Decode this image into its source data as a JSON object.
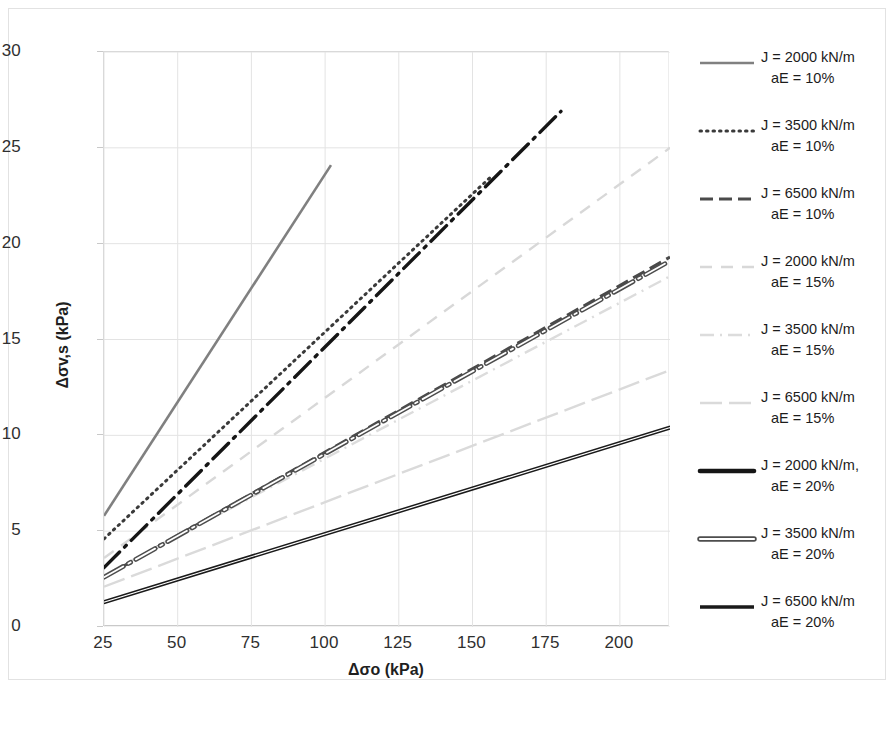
{
  "axes": {
    "xlabel": "Δσo (kPa)",
    "ylabel": "Δσv,s (kPa)",
    "xticks": [
      "25",
      "50",
      "75",
      "100",
      "125",
      "150",
      "175",
      "200"
    ],
    "yticks": [
      "0",
      "5",
      "10",
      "15",
      "20",
      "25",
      "30"
    ]
  },
  "legend": {
    "items": [
      {
        "line1": "J = 2000 kN/m",
        "line2": "aE = 10%",
        "style": "solid-gray",
        "color": "#808080"
      },
      {
        "line1": "J = 3500 kN/m",
        "line2": "aE = 10%",
        "style": "dotted-dark",
        "color": "#3a3a3a"
      },
      {
        "line1": "J = 6500 kN/m",
        "line2": "aE = 10%",
        "style": "dashed-dark",
        "color": "#4a4a4a"
      },
      {
        "line1": "J = 2000 kN/m",
        "line2": "aE = 15%",
        "style": "dashed-light",
        "color": "#d8d8d8"
      },
      {
        "line1": "J = 3500 kN/m",
        "line2": "aE = 15%",
        "style": "dashdot-light",
        "color": "#dcdcdc"
      },
      {
        "line1": "J = 6500 kN/m",
        "line2": "aE = 15%",
        "style": "longdash-light",
        "color": "#dadada"
      },
      {
        "line1": "J = 2000 kN/m,",
        "line2": "aE = 20%",
        "style": "dashdot-black",
        "color": "#151515"
      },
      {
        "line1": "J = 3500 kN/m",
        "line2": "aE = 20%",
        "style": "dashdot-double",
        "color": "#4d4d4d"
      },
      {
        "line1": "J = 6500 kN/m",
        "line2": "aE = 20%",
        "style": "solid-black",
        "color": "#1a1a1a"
      }
    ]
  },
  "chart_data": {
    "type": "line",
    "title": "",
    "xlabel": "Δσo (kPa)",
    "ylabel": "Δσv,s (kPa)",
    "xlim": [
      25,
      217
    ],
    "ylim": [
      0,
      30
    ],
    "xticks": [
      25,
      50,
      75,
      100,
      125,
      150,
      175,
      200
    ],
    "yticks": [
      0,
      5,
      10,
      15,
      20,
      25,
      30
    ],
    "grid": true,
    "legend_position": "right",
    "series": [
      {
        "name": "J = 2000 kN/m, aE = 10%",
        "style": "solid-gray",
        "color": "#808080",
        "x": [
          25,
          102
        ],
        "y": [
          5.8,
          24.1
        ]
      },
      {
        "name": "J = 3500 kN/m, aE = 10%",
        "style": "dotted-dark",
        "color": "#3a3a3a",
        "x": [
          25,
          157
        ],
        "y": [
          4.6,
          23.6
        ]
      },
      {
        "name": "J = 6500 kN/m, aE = 10%",
        "style": "dashed-dark",
        "color": "#4a4a4a",
        "x": [
          25,
          217
        ],
        "y": [
          2.6,
          19.3
        ]
      },
      {
        "name": "J = 2000 kN/m, aE = 15%",
        "style": "dashed-light",
        "color": "#d8d8d8",
        "x": [
          25,
          217
        ],
        "y": [
          3.6,
          25.0
        ]
      },
      {
        "name": "J = 3500 kN/m, aE = 15%",
        "style": "dashdot-light",
        "color": "#dcdcdc",
        "x": [
          25,
          217
        ],
        "y": [
          2.7,
          18.3
        ]
      },
      {
        "name": "J = 6500 kN/m, aE = 15%",
        "style": "longdash-light",
        "color": "#dadada",
        "x": [
          25,
          217
        ],
        "y": [
          2.1,
          13.4
        ]
      },
      {
        "name": "J = 2000 kN/m, aE = 20%",
        "style": "dashdot-black",
        "color": "#151515",
        "x": [
          25,
          180
        ],
        "y": [
          3.1,
          26.9
        ]
      },
      {
        "name": "J = 3500 kN/m, aE = 20%",
        "style": "dashdot-double",
        "color": "#4d4d4d",
        "x": [
          25,
          217
        ],
        "y": [
          2.6,
          19.1
        ]
      },
      {
        "name": "J = 6500 kN/m, aE = 20%",
        "style": "solid-black",
        "color": "#1a1a1a",
        "x": [
          25,
          217
        ],
        "y": [
          1.3,
          10.4
        ]
      }
    ]
  }
}
